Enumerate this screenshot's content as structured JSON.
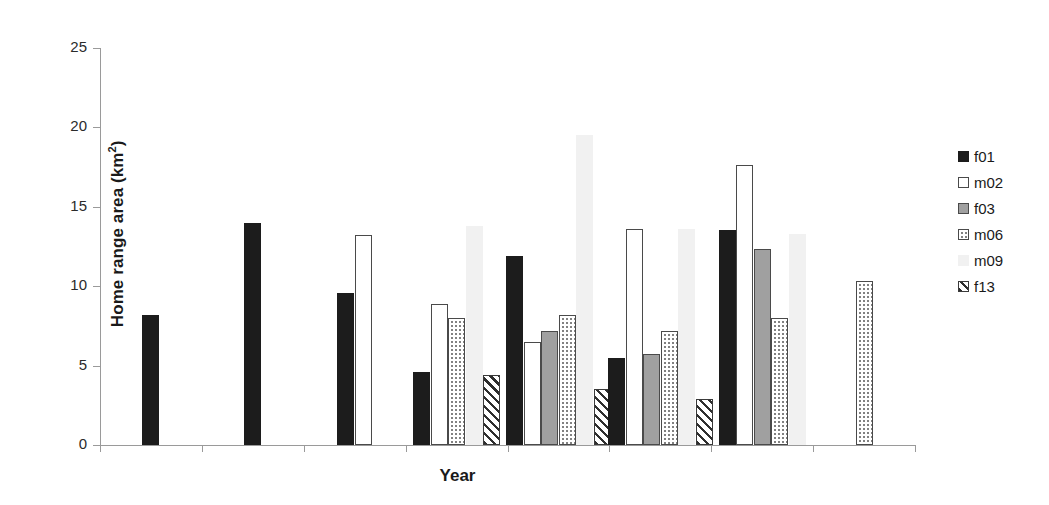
{
  "chart_data": {
    "type": "bar",
    "title": "",
    "xlabel": "Year",
    "ylabel": "Home range area (km²)",
    "ylabel_main": "Home range area (km",
    "ylabel_sup": "2",
    "ylabel_close": ")",
    "ylim": [
      0,
      25
    ],
    "yticks": [
      0,
      5,
      10,
      15,
      20,
      25
    ],
    "ytick_labels": [
      "0",
      "5",
      "10",
      "15",
      "20",
      "25"
    ],
    "grid": false,
    "legend_position": "right",
    "categories": [
      "1",
      "2",
      "3",
      "4",
      "5",
      "6",
      "7",
      "8"
    ],
    "series": [
      {
        "name": "f01",
        "color": "#1c1c1c",
        "pattern": "solid-black",
        "values": [
          8.2,
          14.0,
          9.6,
          4.6,
          11.9,
          5.5,
          13.55,
          null
        ]
      },
      {
        "name": "m02",
        "color": "#ffffff",
        "pattern": "open-white",
        "values": [
          null,
          null,
          13.25,
          8.85,
          6.5,
          13.6,
          17.65,
          null
        ]
      },
      {
        "name": "f03",
        "color": "#a0a0a0",
        "pattern": "solid-gray",
        "values": [
          null,
          null,
          null,
          null,
          7.2,
          5.75,
          12.35,
          null
        ]
      },
      {
        "name": "m06",
        "color": "#ffffff",
        "pattern": "dotted",
        "values": [
          null,
          null,
          null,
          8.0,
          8.2,
          7.15,
          8.0,
          10.3
        ]
      },
      {
        "name": "m09",
        "color": "#f1f1f1",
        "pattern": "very-light-gray",
        "values": [
          null,
          null,
          null,
          13.8,
          19.5,
          13.6,
          13.3,
          null
        ]
      },
      {
        "name": "f13",
        "color": "#2e2e2e",
        "pattern": "diagonal-hatch",
        "values": [
          null,
          null,
          null,
          4.4,
          3.5,
          2.9,
          null,
          null
        ]
      }
    ]
  },
  "legend": {
    "items": [
      {
        "label": "f01"
      },
      {
        "label": "m02"
      },
      {
        "label": "f03"
      },
      {
        "label": "m06"
      },
      {
        "label": "m09"
      },
      {
        "label": "f13"
      }
    ]
  }
}
